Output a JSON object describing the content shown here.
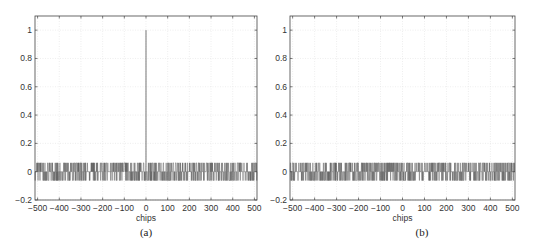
{
  "chart_data": [
    {
      "type": "line",
      "title": "",
      "caption": "(a)",
      "xlabel": "chips",
      "ylabel": "",
      "xlim": [
        -512,
        512
      ],
      "ylim": [
        -0.2,
        1.1
      ],
      "xticks": [
        -500,
        -400,
        -300,
        -200,
        -100,
        0,
        100,
        200,
        300,
        400,
        500
      ],
      "xtick_labels": [
        "−500",
        "−400",
        "−300",
        "−200",
        "−100",
        "0",
        "100",
        "200",
        "300",
        "400",
        "500"
      ],
      "yticks": [
        -0.2,
        0,
        0.2,
        0.4,
        0.6,
        0.8,
        1
      ],
      "ytick_labels": [
        "−0.2",
        "0",
        "0.2",
        "0.4",
        "0.6",
        "0.8",
        "1"
      ],
      "grid": true,
      "description": "Normalized autocorrelation: peak of 1 at lag 0, sidelobes taking values of approximately +0.0625, 0, −0.0625",
      "peak": {
        "x": 0,
        "y": 1
      },
      "sidelobe_levels": [
        0.0625,
        0,
        -0.0625
      ],
      "seed": 7
    },
    {
      "type": "line",
      "title": "",
      "caption": "(b)",
      "xlabel": "chips",
      "ylabel": "",
      "xlim": [
        -512,
        512
      ],
      "ylim": [
        -0.2,
        1.1
      ],
      "xticks": [
        -500,
        -400,
        -300,
        -200,
        -100,
        0,
        100,
        200,
        300,
        400,
        500
      ],
      "xtick_labels": [
        "−500",
        "−400",
        "−300",
        "−200",
        "−100",
        "0",
        "100",
        "200",
        "300",
        "400",
        "500"
      ],
      "yticks": [
        -0.2,
        0,
        0.2,
        0.4,
        0.6,
        0.8,
        1
      ],
      "ytick_labels": [
        "−0.2",
        "0",
        "0.2",
        "0.4",
        "0.6",
        "0.8",
        "1"
      ],
      "grid": true,
      "description": "Normalized cross-correlation: no peak, values approximately +0.0625, 0, −0.0625 across all lags",
      "peak": null,
      "sidelobe_levels": [
        0.0625,
        0,
        -0.0625
      ],
      "seed": 23
    }
  ]
}
